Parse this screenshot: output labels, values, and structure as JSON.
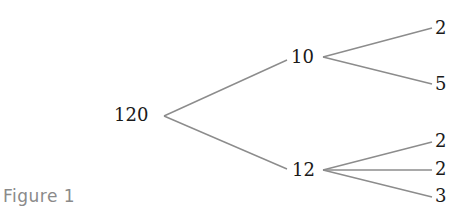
{
  "figure": {
    "caption": "Figure 1",
    "type": "factor-tree",
    "root": {
      "label": "120",
      "children": [
        {
          "label": "10",
          "children": [
            {
              "label": "2"
            },
            {
              "label": "5"
            }
          ]
        },
        {
          "label": "12",
          "children": [
            {
              "label": "2"
            },
            {
              "label": "2"
            },
            {
              "label": "3"
            }
          ]
        }
      ]
    },
    "colors": {
      "text": "#1a1a1a",
      "branch": "#8c8c8c",
      "caption": "#8a8a8a",
      "background": "#ffffff"
    }
  }
}
